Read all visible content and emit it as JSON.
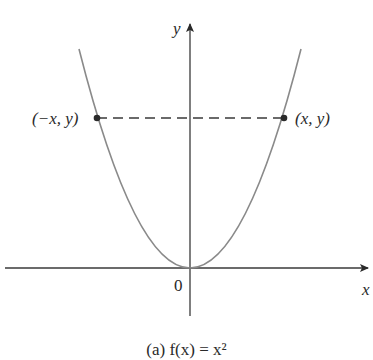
{
  "figure": {
    "axes": {
      "x_label": "x",
      "y_label": "y",
      "origin_label": "0"
    },
    "points": {
      "left_label": "(−x, y)",
      "right_label": "(x, y)"
    },
    "curve": {
      "description": "parabola symmetric about y-axis, vertex at origin",
      "color": "#8a8a8a"
    },
    "dashed_line_color": "#3a3a3a",
    "axis_color": "#3a3a3a",
    "caption_partial": "(a)  f(x) = x²"
  }
}
